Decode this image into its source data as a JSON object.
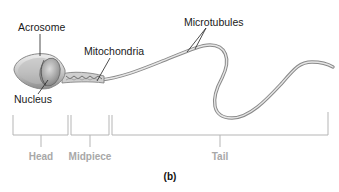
{
  "figure": {
    "panel_label": "(b)",
    "structure_labels": {
      "acrosome": "Acrosome",
      "nucleus": "Nucleus",
      "mitochondria": "Mitochondria",
      "microtubules": "Microtubules"
    },
    "segments": [
      {
        "id": "head",
        "label": "Head"
      },
      {
        "id": "midpiece",
        "label": "Midpiece"
      },
      {
        "id": "tail",
        "label": "Tail"
      }
    ]
  },
  "colors": {
    "label_text": "#1a1a1a",
    "segment_text": "#a8a8a8",
    "bracket_line": "#b5b5b5",
    "cell_fill": "#d4d4d4",
    "cell_outline": "#8a8a8a"
  }
}
